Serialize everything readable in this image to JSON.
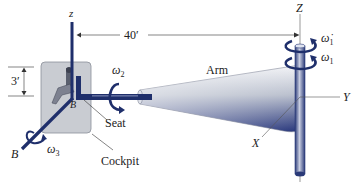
{
  "figure": {
    "type": "engineering-schematic",
    "colors": {
      "shaft_navy": "#1f2f6b",
      "cockpit_fill": "#c9ccd2",
      "cockpit_stroke": "#8a8f99",
      "arm_light": "#eef0f4",
      "arm_dark": "#25347a",
      "line": "#333333"
    },
    "labels": {
      "z_local": "z",
      "z_global": "Z",
      "dimension_arm": "40′",
      "dimension_height": "3′",
      "omega1_dot": "ω̇",
      "omega1_dot_sub": "1",
      "omega1": "ω",
      "omega1_sub": "1",
      "omega2": "ω",
      "omega2_sub": "2",
      "omega3": "ω",
      "omega3_sub": "3",
      "arm": "Arm",
      "seat": "Seat",
      "cockpit": "Cockpit",
      "point_b_center": "B",
      "axis_b": "B",
      "axis_x": "X",
      "axis_y": "Y"
    }
  }
}
